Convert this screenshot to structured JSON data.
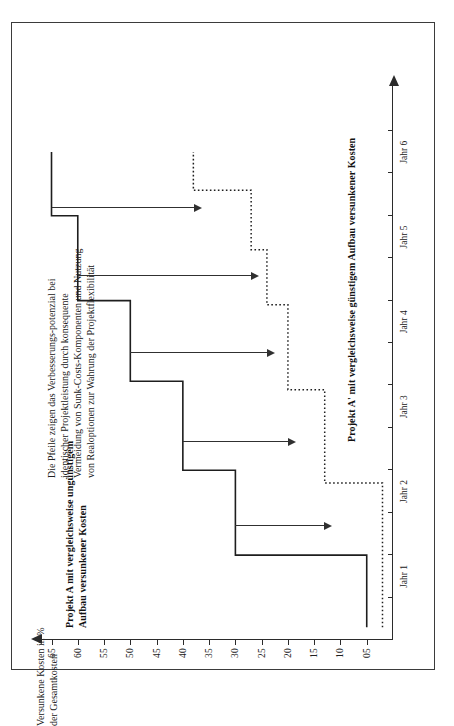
{
  "figure": {
    "value_axis_title": "Versunkene Kosten in %\nder Gesamtkosten",
    "series_caption_a": "Projekt A mit vergleichsweise ungünstigem\nAufbau versunkener Kosten",
    "series_caption_b": "Projekt A' mit vergleichsweise günstigem Aufbau versunkener Kosten",
    "annotation": "Die Pfeile zeigen das Verbesserungs-potenzial bei identischer Projektleistung durch konsequente Vermeidung von Sunk-Costs-Komponenten und Nutzung von Realoptionen zur Wahrung der Projektflexibilität",
    "colors": {
      "axis": "#2b2b2b",
      "series_a": "#1e1e1e",
      "series_b": "#1e1e1e",
      "arrow": "#303030",
      "frame": "#3b3b3b",
      "text": "#202020"
    }
  },
  "chart_data": {
    "type": "line",
    "title": "",
    "subtitle": "",
    "xlabel": "",
    "ylabel": "Versunkene Kosten in % der Gesamtkosten",
    "x_tick_labels": [
      "Jahr 1",
      "Jahr 2",
      "Jahr 3",
      "Jahr 4",
      "Jahr 5",
      "Jahr 6"
    ],
    "y_tick_labels": [
      "65",
      "60",
      "55",
      "50",
      "45",
      "40",
      "35",
      "30",
      "25",
      "20",
      "15",
      "10",
      "05"
    ],
    "y_tick_values": [
      65,
      60,
      55,
      50,
      45,
      40,
      35,
      30,
      25,
      20,
      15,
      10,
      5
    ],
    "ylim": [
      0,
      67
    ],
    "xlim": [
      0,
      6.6
    ],
    "grid": false,
    "legend": "none",
    "interpolation": "step",
    "series": [
      {
        "name": "Projekt A mit vergleichsweise ungünstigem Aufbau versunkener Kosten",
        "style": "solid",
        "x": [
          0.15,
          1.0,
          1.0,
          2.0,
          2.0,
          3.05,
          3.05,
          4.0,
          4.0,
          5.0,
          5.0,
          5.75
        ],
        "values": [
          5,
          5,
          30,
          30,
          40,
          40,
          50,
          50,
          60,
          60,
          65,
          65
        ]
      },
      {
        "name": "Projekt A' mit vergleichsweise günstigem Aufbau versunkener Kosten",
        "style": "dotted",
        "x": [
          0.15,
          1.85,
          1.85,
          2.95,
          2.95,
          3.95,
          3.95,
          4.6,
          4.6,
          5.3,
          5.3,
          5.75
        ],
        "values": [
          2,
          2,
          13,
          13,
          20,
          20,
          24,
          24,
          27,
          27,
          38,
          38
        ]
      }
    ],
    "annotations": [
      {
        "text": "Die Pfeile zeigen das Verbesserungspotenzial bei identischer Projektleistung durch konsequente Vermeidung von Sunk-Costs-Komponenten und Nutzung von Realoptionen zur Wahrung der Projektflexibilität",
        "type": "note"
      },
      {
        "type": "improvement-arrow",
        "year": 1,
        "from": 30,
        "to": 13
      },
      {
        "type": "improvement-arrow",
        "year": 2,
        "from": 40,
        "to": 20
      },
      {
        "type": "improvement-arrow",
        "year": 3,
        "from": 50,
        "to": 24
      },
      {
        "type": "improvement-arrow",
        "year": 4,
        "from": 60,
        "to": 27
      },
      {
        "type": "improvement-arrow",
        "year": 5,
        "from": 65,
        "to": 38
      }
    ]
  }
}
